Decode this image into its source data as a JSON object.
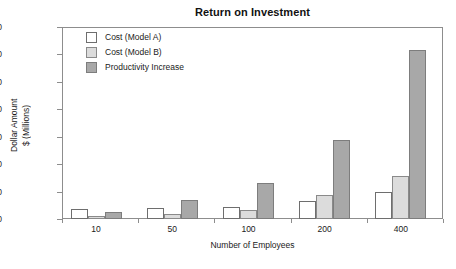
{
  "chart_data": {
    "type": "bar",
    "title": "Return on Investment",
    "xlabel": "Number of Employees",
    "ylabel": "Dollar Amount $ (Millions)",
    "ylabel_lines": [
      "Dollar Amount",
      "$ (Millions)"
    ],
    "categories": [
      "10",
      "50",
      "100",
      "200",
      "400"
    ],
    "series": [
      {
        "name": "Cost (Model A)",
        "color": "#ffffff",
        "values": [
          0.35,
          0.4,
          0.42,
          0.65,
          0.98
        ]
      },
      {
        "name": "Cost (Model B)",
        "color": "#dcdcdc",
        "values": [
          0.12,
          0.2,
          0.33,
          0.88,
          1.58
        ]
      },
      {
        "name": "Productivity Increase",
        "color": "#a8a8a8",
        "values": [
          0.25,
          0.7,
          1.32,
          2.88,
          6.15
        ]
      }
    ],
    "ylim": [
      0,
      7
    ],
    "ytick_values": [
      7,
      6,
      5,
      4,
      3,
      2,
      1,
      0
    ],
    "ytick_labels": [
      "$7.00",
      "6.00",
      "5.00",
      "4.00",
      "3.00",
      "2.00",
      "1.00",
      "0"
    ],
    "grid": false,
    "legend_position": "top-left-inside",
    "frame": true
  }
}
